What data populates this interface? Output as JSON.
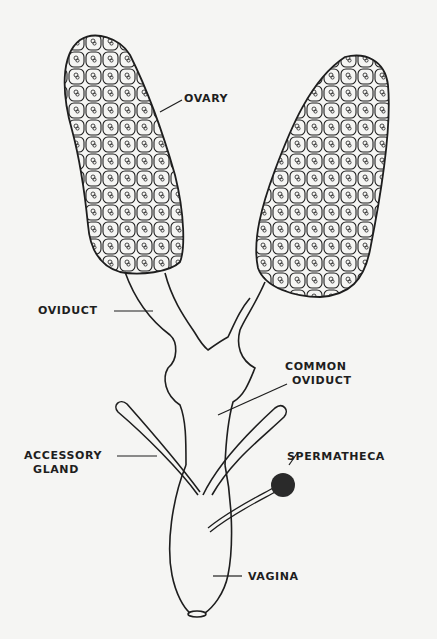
{
  "diagram": {
    "type": "anatomical-illustration",
    "colors": {
      "line": "#1e1e1e",
      "background": "#f5f5f3",
      "spermatheca_fill": "#2a2a2a"
    },
    "labels": {
      "ovary": "OVARY",
      "oviduct": "OVIDUCT",
      "common_oviduct_line1": "COMMON",
      "common_oviduct_line2": "OVIDUCT",
      "accessory_gland_line1": "ACCESSORY",
      "accessory_gland_line2": "GLAND",
      "spermatheca": "SPERMATHECA",
      "vagina": "VAGINA"
    }
  }
}
